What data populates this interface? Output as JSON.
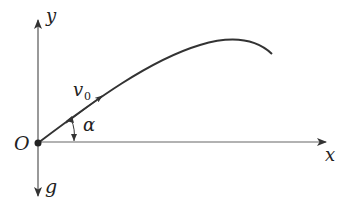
{
  "diagram": {
    "type": "projectile-motion",
    "labels": {
      "y_axis": "y",
      "x_axis": "x",
      "origin": "O",
      "gravity": "g",
      "velocity": "v",
      "velocity_sub": "0",
      "angle": "α"
    },
    "colors": {
      "stroke": "#333333",
      "background": "#ffffff"
    }
  }
}
